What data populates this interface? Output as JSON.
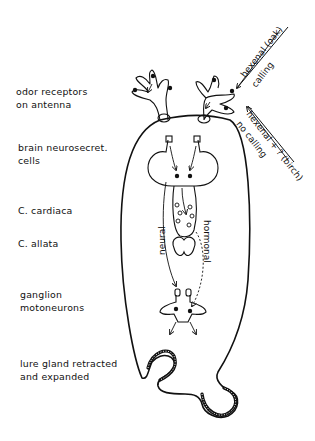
{
  "diagram": {
    "type": "biological schematic",
    "colors": {
      "ink": "#111111",
      "background": "#ffffff"
    }
  },
  "labels": {
    "odor_receptors": [
      "odor receptors",
      "on antenna"
    ],
    "brain": [
      "brain neurosecret.",
      "cells"
    ],
    "cardiaca": "C. cardiaca",
    "allata": "C. allata",
    "ganglion": [
      "ganglion",
      "motoneurons"
    ],
    "lure_gland": [
      "lure gland retracted",
      "and expanded"
    ]
  },
  "stimuli": {
    "oak": {
      "line1": "hexenal (oak)",
      "line2": "calling"
    },
    "birch": {
      "line1": "hexenal + ? (birch)",
      "line2": "no calling"
    }
  },
  "pathways": {
    "neural": "neural",
    "hormonal": "hormonal"
  }
}
